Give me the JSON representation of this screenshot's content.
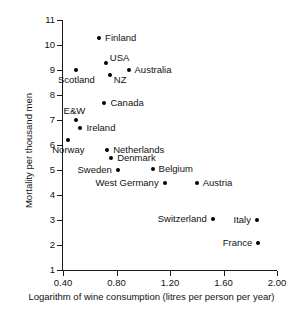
{
  "chart_data": {
    "type": "scatter",
    "title": "",
    "xlabel": "Logarithm of wine consumption (litres per person per year)",
    "ylabel": "Mortality per thousand men",
    "xlim": [
      0.26,
      2.03
    ],
    "ylim": [
      1,
      11
    ],
    "xticks": [
      "0.40",
      "0.80",
      "1.20",
      "1.60",
      "2.00"
    ],
    "xtick_values": [
      0.4,
      0.8,
      1.2,
      1.6,
      2.0
    ],
    "yticks": [
      "1",
      "2",
      "3",
      "4",
      "5",
      "6",
      "7",
      "8",
      "9",
      "10",
      "11"
    ],
    "ytick_values": [
      1,
      2,
      3,
      4,
      5,
      6,
      7,
      8,
      9,
      10,
      11
    ],
    "grid": false,
    "legend": "none",
    "points": [
      {
        "label": "Finland",
        "x": 0.67,
        "y": 10.3,
        "label_pos": "right"
      },
      {
        "label": "USA",
        "x": 0.72,
        "y": 9.3,
        "label_pos": "right-up"
      },
      {
        "label": "Australia",
        "x": 0.89,
        "y": 9.0,
        "label_pos": "right"
      },
      {
        "label": "Scotland",
        "x": 0.5,
        "y": 9.0,
        "label_pos": "below"
      },
      {
        "label": "NZ",
        "x": 0.75,
        "y": 8.8,
        "label_pos": "right-down"
      },
      {
        "label": "Canada",
        "x": 0.71,
        "y": 7.7,
        "label_pos": "right"
      },
      {
        "label": "E&W",
        "x": 0.5,
        "y": 7.0,
        "label_pos": "above-left"
      },
      {
        "label": "Ireland",
        "x": 0.53,
        "y": 6.7,
        "label_pos": "right"
      },
      {
        "label": "Norway",
        "x": 0.44,
        "y": 6.2,
        "label_pos": "below"
      },
      {
        "label": "Netherlands",
        "x": 0.73,
        "y": 5.8,
        "label_pos": "right"
      },
      {
        "label": "Denmark",
        "x": 0.76,
        "y": 5.5,
        "label_pos": "right"
      },
      {
        "label": "Sweden",
        "x": 0.81,
        "y": 5.0,
        "label_pos": "left"
      },
      {
        "label": "Belgium",
        "x": 1.07,
        "y": 5.05,
        "label_pos": "right"
      },
      {
        "label": "West Germany",
        "x": 1.16,
        "y": 4.5,
        "label_pos": "left"
      },
      {
        "label": "Austria",
        "x": 1.4,
        "y": 4.5,
        "label_pos": "right"
      },
      {
        "label": "Switzerland",
        "x": 1.52,
        "y": 3.05,
        "label_pos": "left"
      },
      {
        "label": "Italy",
        "x": 1.85,
        "y": 3.0,
        "label_pos": "left"
      },
      {
        "label": "France",
        "x": 1.86,
        "y": 2.1,
        "label_pos": "left"
      }
    ]
  },
  "colors": {
    "marker": "#000000",
    "axis": "#1a1a1a",
    "text": "#111111",
    "background": "#ffffff"
  }
}
